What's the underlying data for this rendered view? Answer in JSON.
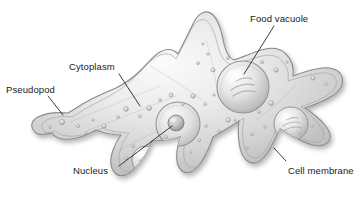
{
  "figure": {
    "background_color": "#ffffff",
    "ink_color": "#1a1a1a",
    "body_fill_light": "#f2f2f2",
    "body_fill_mid": "#c9c9c9",
    "body_fill_dark": "#9a9a9a",
    "membrane_stroke": "#8a8a8a"
  },
  "labels": {
    "food_vacuole": "Food vacuole",
    "cytoplasm": "Cytoplasm",
    "pseudopod": "Pseudopod",
    "nucleus": "Nucleus",
    "cell_membrane": "Cell membrane"
  },
  "structures": [
    {
      "name": "food-vacuole",
      "shape": "large-circle",
      "cx": 243,
      "cy": 87,
      "r": 26
    },
    {
      "name": "secondary-vacuole",
      "shape": "circle",
      "cx": 291,
      "cy": 124,
      "r": 17
    },
    {
      "name": "nucleus-outer",
      "shape": "circle",
      "cx": 178,
      "cy": 124,
      "r": 22
    },
    {
      "name": "nucleolus",
      "shape": "circle",
      "cx": 176,
      "cy": 123,
      "r": 8
    },
    {
      "name": "lower-vacuole",
      "shape": "circle",
      "cx": 146,
      "cy": 160,
      "r": 14
    }
  ],
  "leaders": [
    {
      "name": "leader-food-vacuole",
      "x1": 274,
      "y1": 26,
      "x2": 244,
      "y2": 74
    },
    {
      "name": "leader-cytoplasm",
      "x1": 119,
      "y1": 74,
      "x2": 140,
      "y2": 106
    },
    {
      "name": "leader-pseudopod",
      "x1": 48,
      "y1": 96,
      "x2": 63,
      "y2": 115
    },
    {
      "name": "leader-nucleus",
      "x1": 119,
      "y1": 166,
      "x2": 172,
      "y2": 126
    },
    {
      "name": "leader-cell-membrane",
      "x1": 286,
      "y1": 161,
      "x2": 274,
      "y2": 148
    }
  ]
}
